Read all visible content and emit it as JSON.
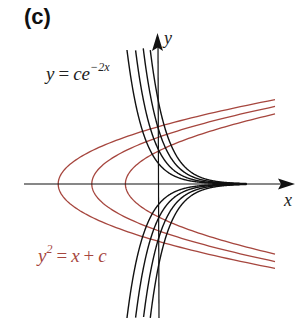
{
  "panel": {
    "label": "(c)"
  },
  "equations": {
    "black": {
      "lhs": "y",
      "eq": "=",
      "rhs_base": "ce",
      "rhs_exp": "−2x"
    },
    "red": {
      "lhs_base": "y",
      "lhs_exp": "2",
      "eq": "=",
      "rhs_a": "x",
      "plus": "+",
      "rhs_b": "c"
    }
  },
  "axes": {
    "x_label": "x",
    "y_label": "y"
  },
  "colors": {
    "black_curves": "#111111",
    "red_curves": "#a6463e",
    "axes": "#111111"
  },
  "chart_data": {
    "type": "line",
    "title": "(c)",
    "xlabel": "x",
    "ylabel": "y",
    "families": [
      {
        "name": "y = ce^{-2x}",
        "color": "#111111",
        "c_values": [
          -2.4,
          -1.6,
          -1.0,
          -0.6,
          0.6,
          1.0,
          1.6,
          2.4
        ]
      },
      {
        "name": "y^2 = x + c",
        "color": "#a6463e",
        "c_values": [
          1,
          2,
          3
        ]
      }
    ],
    "xlim": [
      -4,
      4
    ],
    "ylim": [
      -4,
      4.5
    ],
    "grid": false
  }
}
